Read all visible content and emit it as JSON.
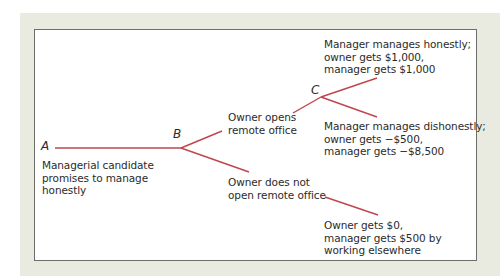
{
  "diagram": {
    "type": "game-tree",
    "line_color": "#c0454f",
    "nodes": {
      "A": "A",
      "B": "B",
      "C": "C"
    },
    "labels": {
      "start": "Managerial candidate\npromises to manage\nhonestly",
      "open_office": "Owner opens\nremote office",
      "not_open_office": "Owner does not\nopen remote office",
      "honest_outcome": "Manager manages honestly;\nowner gets $1,000,\nmanager gets $1,000",
      "dishonest_outcome": "Manager manages dishonestly;\nowner gets −$500,\nmanager gets −$8,500",
      "no_office_outcome": "Owner gets $0,\nmanager gets $500 by\nworking elsewhere"
    }
  }
}
